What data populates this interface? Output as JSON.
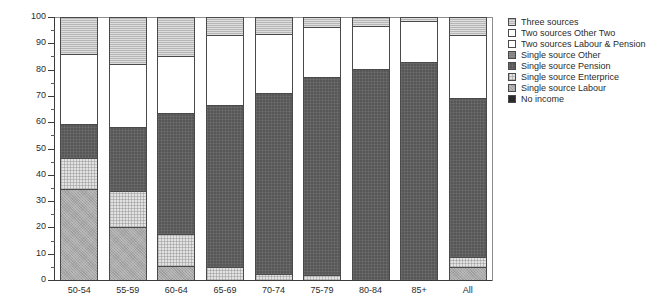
{
  "chart_data": {
    "type": "bar",
    "stacked": true,
    "normalized_percent": true,
    "title": "",
    "subtitle": "",
    "xlabel": "",
    "ylabel": "",
    "ylim": [
      0,
      100
    ],
    "y_major_step": 10,
    "y_minor_step": 5,
    "grid": false,
    "legend_position": "right",
    "categories": [
      "50-54",
      "55-59",
      "60-64",
      "65-69",
      "70-74",
      "75-79",
      "80-84",
      "85+",
      "All"
    ],
    "ytick_labels": [
      "0",
      "10",
      "20",
      "30",
      "40",
      "50",
      "60",
      "70",
      "80",
      "90",
      "100"
    ],
    "series": [
      {
        "name": "No income",
        "key": "no-income",
        "color": "#2a2a2a",
        "pattern": "solid-dark",
        "values": [
          0,
          0,
          0,
          0,
          0,
          0,
          0,
          0,
          0
        ]
      },
      {
        "name": "Single source Labour",
        "key": "single-source-labour",
        "color": "#a8a8a8",
        "pattern": "speckled",
        "values": [
          34.5,
          20.0,
          5.0,
          0,
          0,
          0,
          0,
          0,
          4.5
        ]
      },
      {
        "name": "Single source Enterprice",
        "key": "single-source-enterprice",
        "color": "#e2e2e2",
        "pattern": "fine-grid",
        "values": [
          11.5,
          13.5,
          12.0,
          4.5,
          2.0,
          1.5,
          0,
          0,
          4.0
        ]
      },
      {
        "name": "Single source Pension",
        "key": "single-source-pension",
        "color": "#575757",
        "pattern": "dark-grid",
        "values": [
          13.0,
          24.5,
          46.5,
          62.0,
          69.0,
          75.5,
          80.0,
          83.0,
          60.5
        ]
      },
      {
        "name": "Single source Other",
        "key": "single-source-other",
        "color": "#8e8e8e",
        "pattern": "horizontal-lines",
        "values": [
          0,
          0,
          0,
          0,
          0,
          0,
          0,
          0,
          0
        ]
      },
      {
        "name": "Two sources Labour & Pension",
        "key": "two-sources-labour-pension",
        "color": "#ffffff",
        "pattern": "empty",
        "values": [
          27.0,
          24.0,
          21.5,
          26.5,
          22.5,
          19.0,
          16.5,
          15.5,
          24.0
        ]
      },
      {
        "name": "Two sources Other Two",
        "key": "two-sources-other-two",
        "color": "#ffffff",
        "pattern": "empty",
        "values": [
          0,
          0,
          0,
          0,
          0,
          0,
          0,
          0,
          0
        ]
      },
      {
        "name": "Three sources",
        "key": "three-sources",
        "color": "#b6b6b6",
        "pattern": "horizontal-hatch",
        "values": [
          14.0,
          18.0,
          15.0,
          7.0,
          6.5,
          4.0,
          3.5,
          1.5,
          7.0
        ]
      }
    ]
  },
  "legend": {
    "items": [
      {
        "label": "Three sources",
        "fill": "f-three"
      },
      {
        "label": "Two sources Other Two",
        "fill": "f-twoother"
      },
      {
        "label": "Two sources Labour & Pension",
        "fill": "f-twolp"
      },
      {
        "label": "Single source Other",
        "fill": "f-sother"
      },
      {
        "label": "Single source Pension",
        "fill": "f-spension"
      },
      {
        "label": "Single source Enterprice",
        "fill": "f-senter"
      },
      {
        "label": "Single source Labour",
        "fill": "f-slabour"
      },
      {
        "label": "No income",
        "fill": "f-noincome"
      }
    ]
  }
}
